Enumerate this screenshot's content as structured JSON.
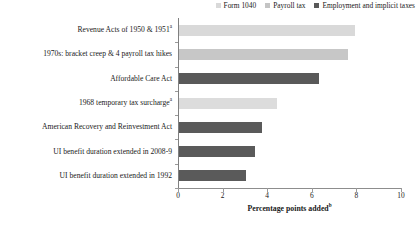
{
  "chart_data": {
    "type": "bar",
    "orientation": "horizontal",
    "title": "",
    "xlabel": "Percentage points added",
    "xlabel_superscript": "b",
    "ylabel": "",
    "xlim": [
      0,
      10
    ],
    "xticks": [
      0,
      2,
      4,
      6,
      8,
      10
    ],
    "grid": false,
    "legend_position": "top-right",
    "categories": [
      "Revenue Acts of 1950 & 1951",
      "1970s: bracket creep & 4 payroll tax hikes",
      "Affordable Care Act",
      "1968 temporary tax surcharge",
      "American Recovery and Reinvestment Act",
      "UI benefit duration extended in 2008-9",
      "UI benefit duration extended in 1992"
    ],
    "category_superscripts": [
      "a",
      "",
      "",
      "a",
      "",
      "",
      ""
    ],
    "values": [
      7.9,
      7.6,
      6.3,
      4.4,
      3.7,
      3.4,
      3.0
    ],
    "series_of_bar": [
      "Form 1040",
      "Payroll tax",
      "Employment and implicit taxes",
      "Form 1040",
      "Employment and implicit taxes",
      "Employment and implicit taxes",
      "Employment and implicit taxes"
    ],
    "legend": [
      {
        "label": "Form 1040",
        "color": "#d9d9d9"
      },
      {
        "label": "Payroll tax",
        "color": "#c4c4c4"
      },
      {
        "label": "Employment and implicit taxes",
        "color": "#595959"
      }
    ],
    "bar_colors": [
      "#d9d9d9",
      "#c7c7c7",
      "#595959",
      "#dcdcdc",
      "#5a5a5a",
      "#5a5a5a",
      "#5a5a5a"
    ]
  }
}
